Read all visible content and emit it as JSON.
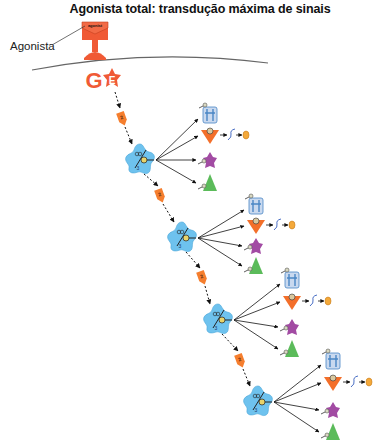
{
  "title": "Agonista total: transdução máxima de sinais",
  "labels": {
    "agonist_callout": "Agonista",
    "agonist_box": "agonist",
    "g_protein": "G",
    "effector": "E",
    "kinase_badge": "2",
    "enzyme_badge": "3"
  },
  "colors": {
    "receptor": "#f05a35",
    "kinase": "#f57e2e",
    "enzyme": "#6ec2ee",
    "channel": "#4a86c5",
    "triangle": "#f36f2a",
    "purple": "#a24ba3",
    "green": "#5bbb5a",
    "ligand": "#f4a93a",
    "membrane": "#666666"
  },
  "cascade_levels": [
    {
      "level": 1,
      "enzyme": {
        "x": 140,
        "y": 160
      },
      "kinase_above": {
        "x": 122,
        "y": 118
      },
      "targets_x": 210,
      "channel_y": 115,
      "triangle_y": 136,
      "purple_y": 160,
      "green_y": 183,
      "ligand": {
        "x": 263,
        "y": 136
      }
    },
    {
      "level": 2,
      "enzyme": {
        "x": 182,
        "y": 238
      },
      "kinase_above": {
        "x": 160,
        "y": 195
      },
      "targets_x": 256,
      "channel_y": 206,
      "triangle_y": 226,
      "purple_y": 246,
      "green_y": 266,
      "ligand": {
        "x": 302,
        "y": 216
      }
    },
    {
      "level": 3,
      "enzyme": {
        "x": 218,
        "y": 320
      },
      "kinase_above": {
        "x": 202,
        "y": 277
      },
      "targets_x": 292,
      "channel_y": 280,
      "triangle_y": 302,
      "purple_y": 327,
      "green_y": 349,
      "ligand": {
        "x": 340,
        "y": 298
      }
    },
    {
      "level": 4,
      "enzyme": {
        "x": 258,
        "y": 402
      },
      "kinase_above": {
        "x": 240,
        "y": 360
      },
      "targets_x": 333,
      "channel_y": 361,
      "triangle_y": 383,
      "purple_y": 410,
      "green_y": 432,
      "ligand": {
        "x": 377,
        "y": 383
      }
    }
  ]
}
